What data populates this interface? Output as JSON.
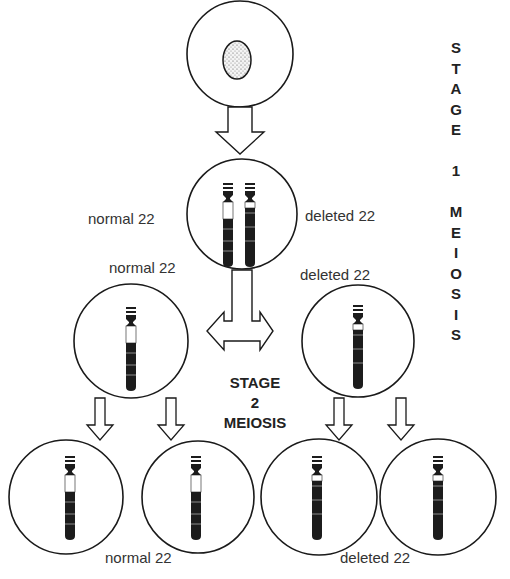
{
  "diagram": {
    "colors": {
      "stroke": "#1a1a1a",
      "chromosome": "#1c1c1c",
      "background": "#ffffff",
      "text": "#333333"
    },
    "cells": {
      "parent": {
        "label": "",
        "content": "nucleus"
      },
      "stage1": {
        "left_label": "normal 22",
        "right_label": "deleted 22",
        "content": "chromosome pair"
      },
      "stage1_products": [
        {
          "label": "normal 22",
          "content": "normal chromosome"
        },
        {
          "label": "deleted 22",
          "content": "deleted chromosome"
        }
      ],
      "stage2_products": [
        {
          "content": "normal chromosome"
        },
        {
          "content": "normal chromosome"
        },
        {
          "content": "deleted chromosome"
        },
        {
          "content": "deleted chromosome"
        }
      ],
      "stage2_labels": {
        "normal": "normal 22",
        "deleted": "deleted 22"
      }
    },
    "stage1_heading": [
      "S",
      "T",
      "A",
      "G",
      "E",
      "",
      "1",
      "",
      "M",
      "E",
      "I",
      "O",
      "S",
      "I",
      "S"
    ],
    "stage2_heading": {
      "line1": "STAGE",
      "line2": "2",
      "line3": "MEIOSIS"
    },
    "arrows": [
      {
        "type": "down",
        "from": "parent",
        "to": "stage1"
      },
      {
        "type": "split",
        "from": "stage1",
        "to": [
          "normal 22",
          "deleted 22"
        ]
      },
      {
        "type": "down",
        "from": "normal 22",
        "to": "daughter-1"
      },
      {
        "type": "down",
        "from": "normal 22",
        "to": "daughter-2"
      },
      {
        "type": "down",
        "from": "deleted 22",
        "to": "daughter-3"
      },
      {
        "type": "down",
        "from": "deleted 22",
        "to": "daughter-4"
      }
    ]
  }
}
